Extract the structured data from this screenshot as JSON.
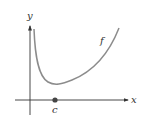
{
  "diagram": {
    "axes": {
      "x_label": "x",
      "y_label": "y"
    },
    "curve": {
      "label": "f",
      "color": "#8c8c8c"
    },
    "point": {
      "label": "c",
      "color": "#444444"
    },
    "axis_color": "#333333"
  }
}
